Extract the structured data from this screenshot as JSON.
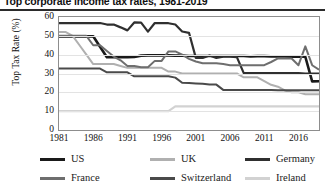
{
  "chart_data": {
    "type": "line",
    "title": "Top corporate income tax rates, 1981-2019",
    "xlabel": "",
    "ylabel": "Top Tax Rate (%)",
    "xlim": [
      1981,
      2019
    ],
    "ylim": [
      0,
      60
    ],
    "yticks": [
      0,
      10,
      20,
      30,
      40,
      50,
      60
    ],
    "xticks": [
      1981,
      1986,
      1991,
      1996,
      2001,
      2006,
      2011,
      2016
    ],
    "grid": true,
    "legend_position": "bottom",
    "x": [
      1981,
      1982,
      1983,
      1984,
      1985,
      1986,
      1987,
      1988,
      1989,
      1990,
      1991,
      1992,
      1993,
      1994,
      1995,
      1996,
      1997,
      1998,
      1999,
      2000,
      2001,
      2002,
      2003,
      2004,
      2005,
      2006,
      2007,
      2008,
      2009,
      2010,
      2011,
      2012,
      2013,
      2014,
      2015,
      2016,
      2017,
      2018,
      2019
    ],
    "series": [
      {
        "name": "US",
        "color": "#1a1a1a",
        "values": [
          49.7,
          49.7,
          49.7,
          49.7,
          49.7,
          49.8,
          44.2,
          38.6,
          38.6,
          38.6,
          38.7,
          38.8,
          39.5,
          39.6,
          39.6,
          39.6,
          39.6,
          39.5,
          39.5,
          39.3,
          39.3,
          39.3,
          39.3,
          39.3,
          39.3,
          39.3,
          39.3,
          39.3,
          39.1,
          39.2,
          39.2,
          39.1,
          39.1,
          39.1,
          38.9,
          38.9,
          38.9,
          25.8,
          25.9
        ]
      },
      {
        "name": "UK",
        "color": "#b0b0b0",
        "values": [
          52.0,
          52.0,
          50.0,
          45.0,
          40.0,
          35.0,
          35.0,
          35.0,
          35.0,
          34.0,
          33.0,
          33.0,
          33.0,
          33.0,
          33.0,
          33.0,
          31.0,
          31.0,
          30.0,
          30.0,
          30.0,
          30.0,
          30.0,
          30.0,
          30.0,
          30.0,
          30.0,
          28.0,
          28.0,
          28.0,
          26.0,
          24.0,
          23.0,
          21.0,
          20.0,
          20.0,
          19.0,
          19.0,
          19.0
        ]
      },
      {
        "name": "Germany",
        "color": "#2f2f2f",
        "values": [
          56.8,
          56.8,
          56.8,
          56.8,
          56.8,
          56.8,
          56.8,
          56.0,
          56.0,
          54.5,
          52.9,
          57.1,
          57.0,
          52.2,
          56.8,
          56.7,
          56.7,
          56.0,
          52.3,
          51.6,
          38.3,
          38.3,
          39.6,
          38.3,
          38.9,
          38.9,
          38.7,
          30.2,
          30.2,
          30.2,
          30.2,
          30.2,
          30.2,
          30.2,
          30.2,
          30.2,
          30.0,
          30.0,
          29.9
        ]
      },
      {
        "name": "France",
        "color": "#6e6e6e",
        "values": [
          50.0,
          50.0,
          50.0,
          50.0,
          50.0,
          45.0,
          45.0,
          42.0,
          39.0,
          37.0,
          34.0,
          34.0,
          33.3,
          33.3,
          36.7,
          36.7,
          41.7,
          41.7,
          40.0,
          37.8,
          36.4,
          35.4,
          35.4,
          35.4,
          35.0,
          34.4,
          34.4,
          34.4,
          34.4,
          34.4,
          34.4,
          36.1,
          38.0,
          38.0,
          38.0,
          34.4,
          44.4,
          34.4,
          32.0
        ]
      },
      {
        "name": "Switzerland",
        "color": "#4a4a4a",
        "values": [
          32.6,
          32.6,
          32.6,
          32.6,
          32.6,
          32.6,
          32.6,
          30.6,
          30.6,
          30.6,
          30.6,
          28.5,
          28.5,
          28.5,
          28.5,
          28.5,
          28.5,
          27.8,
          25.1,
          24.9,
          24.7,
          24.5,
          24.1,
          24.1,
          21.3,
          21.3,
          21.3,
          21.2,
          21.2,
          21.2,
          21.2,
          21.2,
          21.1,
          21.1,
          21.1,
          21.1,
          21.1,
          21.1,
          21.1
        ]
      },
      {
        "name": "Ireland",
        "color": "#d2d2d2",
        "values": [
          10.0,
          10.0,
          10.0,
          10.0,
          10.0,
          10.0,
          10.0,
          10.0,
          10.0,
          10.0,
          10.0,
          10.0,
          10.0,
          10.0,
          10.0,
          10.0,
          10.0,
          12.5,
          12.5,
          12.5,
          12.5,
          12.5,
          12.5,
          12.5,
          12.5,
          12.5,
          12.5,
          12.5,
          12.5,
          12.5,
          12.5,
          12.5,
          12.5,
          12.5,
          12.5,
          12.5,
          12.5,
          12.5,
          12.5
        ]
      }
    ],
    "legend_rows": [
      [
        "US",
        "UK",
        "Germany"
      ],
      [
        "France",
        "Switzerland",
        "Ireland"
      ]
    ]
  }
}
